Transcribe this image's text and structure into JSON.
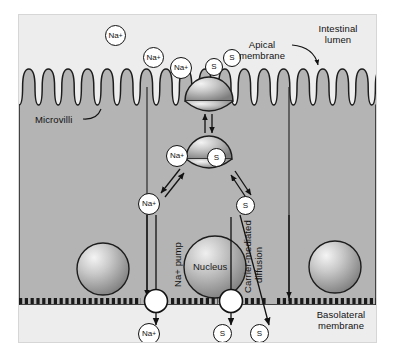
{
  "figure": {
    "type": "biological-diagram"
  },
  "colors": {
    "lumen_bg": "#ededed",
    "cytoplasm_bg": "#b4b4b4",
    "frame_bg": "#f2f2f2",
    "outline": "#121212",
    "molecule_fill": "#ffffff",
    "carrier_light": "#f0f0f0",
    "carrier_dark": "#8a8a8a",
    "membrane_line": "#1a1a1a"
  },
  "labels": {
    "intestinal_lumen": "Intestinal\nlumen",
    "apical_membrane": "Apical\nmembrane",
    "microvilli": "Microvilli",
    "nucleus": "Nucleus",
    "na_pump": "Na+ pump",
    "carrier_mediated": "Carrier-mediated",
    "diffusion": "diffusion",
    "basolateral_membrane": "Basolateral\nmembrane"
  },
  "molecules": {
    "sodium_symbol": "Na",
    "sodium_charge": "+",
    "solute_symbol": "S",
    "lumen_sodium": [
      {
        "id": "na-lumen-1",
        "x": 104,
        "y": 20
      },
      {
        "id": "na-lumen-2",
        "x": 142,
        "y": 40
      },
      {
        "id": "na-lumen-3",
        "x": 170,
        "y": 49
      }
    ],
    "lumen_solute": [
      {
        "id": "s-lumen-1",
        "x": 228,
        "y": 42
      },
      {
        "id": "s-apical-carrier",
        "x": 209,
        "y": 50
      }
    ],
    "cytoplasm": [
      {
        "id": "na-carrier-bound",
        "label": "Na+",
        "x": 166,
        "y": 140
      },
      {
        "id": "s-carrier-bound",
        "label": "S",
        "x": 207,
        "y": 143
      },
      {
        "id": "na-cytoplasm",
        "label": "Na+",
        "x": 137,
        "y": 188
      },
      {
        "id": "s-cytoplasm",
        "label": "S",
        "x": 235,
        "y": 190
      }
    ],
    "below_basolateral": [
      {
        "id": "na-interstitial",
        "label": "Na+",
        "x": 137,
        "y": 318
      },
      {
        "id": "s-interstitial-1",
        "label": "S",
        "x": 212,
        "y": 318
      },
      {
        "id": "s-interstitial-2",
        "label": "S",
        "x": 248,
        "y": 318
      }
    ]
  },
  "structures": {
    "apical_carrier": {
      "name": "apical-cotransporter",
      "cx": 190,
      "cy": 72
    },
    "cytoplasmic_carrier": {
      "name": "cytoplasmic-carrier",
      "cx": 190,
      "cy": 130
    },
    "nucleus_cell": {
      "name": "nucleus",
      "cx": 196,
      "cy": 252,
      "r": 31
    },
    "nucleus_left": {
      "name": "neighbor-nucleus-left",
      "cx": 84,
      "cy": 254,
      "r": 26
    },
    "nucleus_right": {
      "name": "neighbor-nucleus-right",
      "cx": 316,
      "cy": 252,
      "r": 26
    },
    "pump_left": {
      "name": "sodium-pump",
      "cx": 137,
      "cy": 286,
      "r": 11
    },
    "pump_right": {
      "name": "carrier-protein-basolateral",
      "cx": 212,
      "cy": 286,
      "r": 11
    },
    "cell_boundary_left_x": 128,
    "cell_boundary_right_x": 270,
    "membrane_y": 286,
    "microvilli_count": 21
  }
}
